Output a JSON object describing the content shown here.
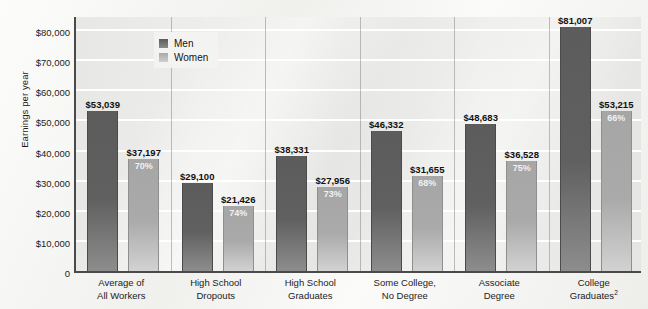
{
  "chart_data": {
    "type": "bar",
    "title": "",
    "subtitle": "",
    "xlabel": "",
    "ylabel": "Earnings per year",
    "ylim": [
      0,
      85000
    ],
    "grid": true,
    "legend_position": "top-left-inside",
    "categories": [
      "Average of\nAll Workers",
      "High School\nDropouts",
      "High School\nGraduates",
      "Some College,\nNo Degree",
      "Associate\nDegree",
      "College\nGraduates2"
    ],
    "category_lines": [
      [
        "Average of",
        "All Workers"
      ],
      [
        "High School",
        "Dropouts"
      ],
      [
        "High School",
        "Graduates"
      ],
      [
        "Some College,",
        "No Degree"
      ],
      [
        "Associate",
        "Degree"
      ],
      [
        "College",
        "Graduates"
      ]
    ],
    "category_footnote_index": 5,
    "category_footnote_marker": "2",
    "ytick_labels": [
      "$80,000",
      "$70,000",
      "$60,000",
      "$50,000",
      "$40,000",
      "$30,000",
      "$20,000",
      "$10,000",
      "0"
    ],
    "ytick_values": [
      80000,
      70000,
      60000,
      50000,
      40000,
      30000,
      20000,
      10000,
      0
    ],
    "series": [
      {
        "name": "Men",
        "color": "#5c5c5c",
        "values": [
          53039,
          29100,
          38331,
          46332,
          48683,
          81007
        ],
        "labels": [
          "$53,039",
          "$29,100",
          "$38,331",
          "$46,332",
          "$48,683",
          "$81,007"
        ]
      },
      {
        "name": "Women",
        "color": "#a8a8a8",
        "values": [
          37197,
          21426,
          27956,
          31655,
          36528,
          53215
        ],
        "labels": [
          "$37,197",
          "$21,426",
          "$27,956",
          "$31,655",
          "$36,528",
          "$53,215"
        ],
        "ratio_labels": [
          "70%",
          "74%",
          "73%",
          "68%",
          "75%",
          "66%"
        ]
      }
    ]
  },
  "legend": {
    "items": [
      {
        "label": "Men",
        "swatch": "men"
      },
      {
        "label": "Women",
        "swatch": "women"
      }
    ]
  }
}
